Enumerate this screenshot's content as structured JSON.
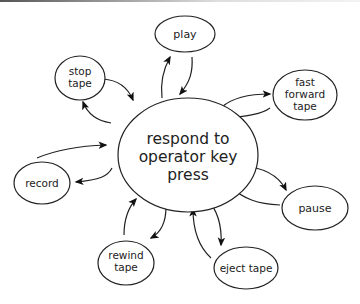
{
  "diagram": {
    "type": "state-transition",
    "center": {
      "id": "respond",
      "lines": [
        "respond to",
        "operator key",
        "press"
      ]
    },
    "nodes": [
      {
        "id": "play",
        "lines": [
          "play"
        ]
      },
      {
        "id": "fast_forward",
        "lines": [
          "fast",
          "forward",
          "tape"
        ]
      },
      {
        "id": "pause",
        "lines": [
          "pause"
        ]
      },
      {
        "id": "eject",
        "lines": [
          "eject tape"
        ]
      },
      {
        "id": "rewind",
        "lines": [
          "rewind",
          "tape"
        ]
      },
      {
        "id": "record",
        "lines": [
          "record"
        ]
      },
      {
        "id": "stop",
        "lines": [
          "stop",
          "tape"
        ]
      }
    ],
    "edges": [
      {
        "from": "respond",
        "to": "play"
      },
      {
        "from": "play",
        "to": "respond"
      },
      {
        "from": "respond",
        "to": "fast_forward"
      },
      {
        "from": "fast_forward",
        "to": "respond"
      },
      {
        "from": "respond",
        "to": "pause"
      },
      {
        "from": "pause",
        "to": "respond"
      },
      {
        "from": "respond",
        "to": "eject"
      },
      {
        "from": "eject",
        "to": "respond"
      },
      {
        "from": "respond",
        "to": "rewind"
      },
      {
        "from": "rewind",
        "to": "respond"
      },
      {
        "from": "respond",
        "to": "record"
      },
      {
        "from": "record",
        "to": "respond"
      },
      {
        "from": "respond",
        "to": "stop"
      },
      {
        "from": "stop",
        "to": "respond"
      }
    ]
  }
}
